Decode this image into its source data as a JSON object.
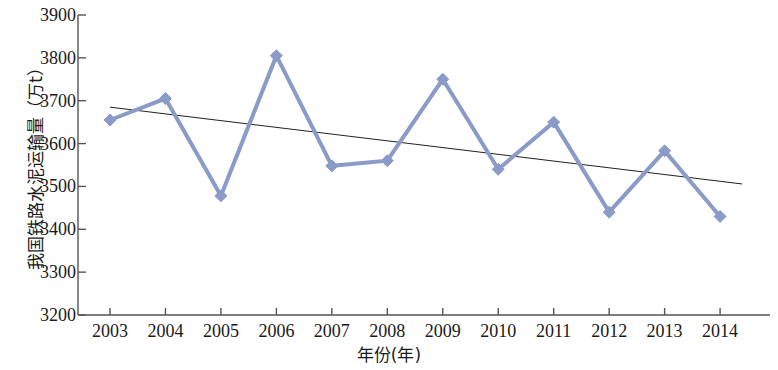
{
  "chart_data": {
    "type": "line",
    "title": "",
    "xlabel": "年份(年)",
    "ylabel": "我国铁路水泥运输量（万t）",
    "categories": [
      "2003",
      "2004",
      "2005",
      "2006",
      "2007",
      "2008",
      "2009",
      "2010",
      "2011",
      "2012",
      "2013",
      "2014"
    ],
    "x": [
      2003,
      2004,
      2005,
      2006,
      2007,
      2008,
      2009,
      2010,
      2011,
      2012,
      2013,
      2014
    ],
    "series": [
      {
        "name": "我国铁路水泥运输量",
        "values": [
          3655,
          3705,
          3478,
          3805,
          3548,
          3560,
          3750,
          3540,
          3650,
          3440,
          3583,
          3430
        ],
        "color": "#8a9bc8",
        "marker": "diamond",
        "line_width": 4
      },
      {
        "name": "趋势线",
        "type": "trendline",
        "values": [
          3685,
          3669,
          3653,
          3638,
          3622,
          3606,
          3591,
          3575,
          3559,
          3544,
          3528,
          3512
        ],
        "color": "#222222",
        "line_width": 1
      }
    ],
    "ylim": [
      3200,
      3900
    ],
    "ytick_step": 100,
    "ytick_labels": [
      "3900",
      "3800",
      "3700",
      "3600",
      "3500",
      "3400",
      "3300",
      "3200"
    ],
    "ytick_values": [
      3900,
      3800,
      3700,
      3600,
      3500,
      3400,
      3300,
      3200
    ],
    "xtick_labels": [
      "2003",
      "2004",
      "2005",
      "2006",
      "2007",
      "2008",
      "2009",
      "2010",
      "2011",
      "2012",
      "2013",
      "2014"
    ],
    "grid": false,
    "legend": "none",
    "axis_color": "#555555",
    "background": "#ffffff"
  }
}
